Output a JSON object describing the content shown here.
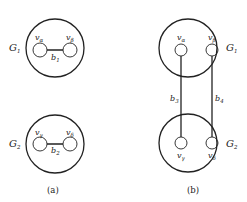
{
  "figure": {
    "panel_a": {
      "caption": "(a)",
      "graphs": [
        {
          "name": "G",
          "index": "1",
          "vertices": [
            {
              "symbol": "v",
              "sub": "α"
            },
            {
              "symbol": "v",
              "sub": "β"
            }
          ],
          "edge": {
            "symbol": "b",
            "sub": "1"
          }
        },
        {
          "name": "G",
          "index": "2",
          "vertices": [
            {
              "symbol": "v",
              "sub": "γ"
            },
            {
              "symbol": "v",
              "sub": "δ"
            }
          ],
          "edge": {
            "symbol": "b",
            "sub": "2"
          }
        }
      ]
    },
    "panel_b": {
      "caption": "(b)",
      "graphs": [
        {
          "name": "G",
          "index": "1",
          "vertices": [
            {
              "symbol": "v",
              "sub": "α"
            },
            {
              "symbol": "v",
              "sub": "β"
            }
          ]
        },
        {
          "name": "G",
          "index": "2",
          "vertices": [
            {
              "symbol": "v",
              "sub": "γ"
            },
            {
              "symbol": "v",
              "sub": "δ"
            }
          ]
        }
      ],
      "edges": [
        {
          "symbol": "b",
          "sub": "3"
        },
        {
          "symbol": "b",
          "sub": "4"
        }
      ]
    }
  }
}
